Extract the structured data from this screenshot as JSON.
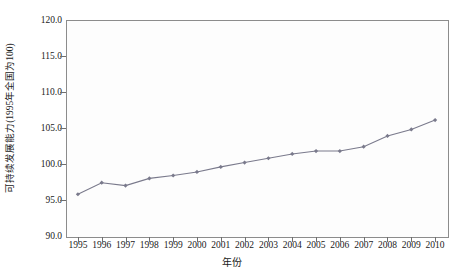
{
  "chart_data": {
    "type": "line",
    "title": "",
    "subtitle": "",
    "xlabel": "年份",
    "ylabel": "可持续发展能力(1995年全国为100)",
    "x": [
      1995,
      1996,
      1997,
      1998,
      1999,
      2000,
      2001,
      2002,
      2003,
      2004,
      2005,
      2006,
      2007,
      2008,
      2009,
      2010
    ],
    "categories": [
      "1995",
      "1996",
      "1997",
      "1998",
      "1999",
      "2000",
      "2001",
      "2002",
      "2003",
      "2004",
      "2005",
      "2006",
      "2007",
      "2008",
      "2009",
      "2010"
    ],
    "values": [
      95.8,
      97.4,
      97.0,
      98.0,
      98.4,
      98.9,
      99.6,
      100.2,
      100.8,
      101.4,
      101.8,
      101.8,
      102.4,
      103.9,
      104.8,
      106.1
    ],
    "series": [
      {
        "name": "可持续发展能力",
        "values": [
          95.8,
          97.4,
          97.0,
          98.0,
          98.4,
          98.9,
          99.6,
          100.2,
          100.8,
          101.4,
          101.8,
          101.8,
          102.4,
          103.9,
          104.8,
          106.1
        ],
        "color": "#7a7a8c",
        "marker": "diamond"
      }
    ],
    "ylim": [
      90.0,
      120.0
    ],
    "xlim": [
      1995,
      2010
    ],
    "yticks": [
      "90.0",
      "95.0",
      "100.0",
      "105.0",
      "110.0",
      "115.0",
      "120.0"
    ],
    "ytick_values": [
      90.0,
      95.0,
      100.0,
      105.0,
      110.0,
      115.0,
      120.0
    ],
    "grid": false,
    "legend": "none",
    "line_color": "#7a7a8c",
    "axis_color": "#8c8c8c",
    "plot_background": "#fdfdfd",
    "figure_background": "#ffffff"
  }
}
